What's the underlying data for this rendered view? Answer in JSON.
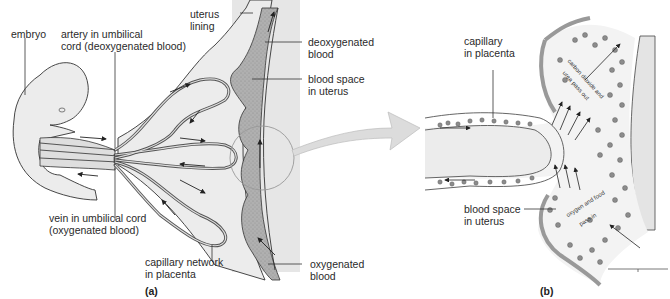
{
  "figure": {
    "panels": [
      {
        "id": "a",
        "label": "(a)",
        "labels": {
          "embryo": "embryo",
          "artery_line1": "artery in umbilical",
          "artery_line2": "cord (deoxygenated blood)",
          "uterus_line1": "uterus",
          "uterus_line2": "lining",
          "deoxy_line1": "deoxygenated",
          "deoxy_line2": "blood",
          "bloodspace_line1": "blood space",
          "bloodspace_line2": "in uterus",
          "vein_line1": "vein in umbilical cord",
          "vein_line2": "(oxygenated blood)",
          "capnet_line1": "capillary network",
          "capnet_line2": "in placenta",
          "oxy_line1": "oxygenated",
          "oxy_line2": "blood"
        }
      },
      {
        "id": "b",
        "label": "(b)",
        "labels": {
          "capillary_line1": "capillary",
          "capillary_line2": "in placenta",
          "co2_line1": "carbon dioxide and",
          "co2_line2": "urea pass out",
          "o2_line1": "oxygen and food",
          "o2_line2": "pass in",
          "bloodspace_line1": "blood space",
          "bloodspace_line2": "in uterus"
        }
      }
    ],
    "colors": {
      "uterus_wall": "#e4e4e4",
      "blood_space": "#a9a9a9",
      "embryo_fill": "#ececec",
      "line": "#3a3a3a",
      "magnify_arrow": "#d8d8d8"
    }
  }
}
